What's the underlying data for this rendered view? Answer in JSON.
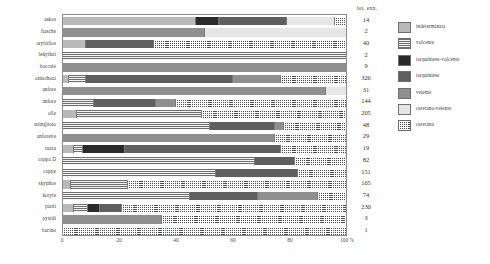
{
  "chart_data": {
    "type": "bar",
    "subtype": "100% stacked horizontal bar",
    "title": "",
    "xlabel": "",
    "ylabel": "",
    "xlim": [
      0,
      100
    ],
    "xticks": [
      {
        "value": 0,
        "label": "0"
      },
      {
        "value": 20,
        "label": "20"
      },
      {
        "value": 40,
        "label": "40"
      },
      {
        "value": 60,
        "label": "60"
      },
      {
        "value": 80,
        "label": "80"
      },
      {
        "value": 100,
        "label": "100 %"
      }
    ],
    "grid": false,
    "legend_position": "right",
    "series": [
      {
        "name": "indeterminata",
        "key": "indeterminata",
        "pattern": "solid-light-gray",
        "color": "#b9b9b9"
      },
      {
        "name": "volcente",
        "key": "volcente",
        "pattern": "horizontal-lines",
        "color": "#f2f2f2"
      },
      {
        "name": "tarquiniese-volcente",
        "key": "tarquiniese_volcente",
        "pattern": "solid-black",
        "color": "#2a2a2a"
      },
      {
        "name": "tarquiniese",
        "key": "tarquiniese",
        "pattern": "solid-dark-gray",
        "color": "#5f5f5f"
      },
      {
        "name": "veiente",
        "key": "veiente",
        "pattern": "solid-mid-gray",
        "color": "#8f8f8f"
      },
      {
        "name": "ceretano-veiente",
        "key": "ceretano_veiente",
        "pattern": "solid-near-white",
        "color": "#e6e6e6"
      },
      {
        "name": "ceretana",
        "key": "ceretana",
        "pattern": "grid-dots",
        "color": "#4a4a4a"
      }
    ],
    "categories": [
      "askos",
      "fiasche",
      "aryballos",
      "lekythoi",
      "boccale",
      "oinochoai",
      "anfore",
      "anfore",
      "olle",
      "attingitoio",
      "anforette",
      "tazza",
      "coppa D",
      "coppe",
      "skyphos",
      "kotyle",
      "piatti",
      "pyxidi",
      "bacino"
    ],
    "totals_header": "tot. exx.",
    "rows": [
      {
        "label": "askos",
        "total": "14",
        "values": [
          47,
          0,
          8,
          24,
          0,
          17,
          4
        ]
      },
      {
        "label": "fiasche",
        "total": "2",
        "values": [
          0,
          0,
          0,
          0,
          50,
          50,
          0
        ]
      },
      {
        "label": "aryballos",
        "total": "40",
        "values": [
          8,
          0,
          0,
          24,
          0,
          0,
          68
        ]
      },
      {
        "label": "lekythoi",
        "total": "2",
        "values": [
          0,
          100,
          0,
          0,
          0,
          0,
          0
        ]
      },
      {
        "label": "boccale",
        "total": "9",
        "values": [
          0,
          0,
          0,
          0,
          100,
          0,
          0
        ]
      },
      {
        "label": "oinochoai",
        "total": "326",
        "values": [
          2,
          6,
          0,
          52,
          17,
          0,
          23
        ]
      },
      {
        "label": "anfore",
        "total": "31",
        "values": [
          0,
          0,
          0,
          0,
          93,
          7,
          0
        ]
      },
      {
        "label": "anfore",
        "total": "144",
        "values": [
          0,
          11,
          0,
          22,
          7,
          0,
          60
        ]
      },
      {
        "label": "olle",
        "total": "205",
        "values": [
          5,
          44,
          0,
          0,
          0,
          0,
          51
        ]
      },
      {
        "label": "attingitoio",
        "total": "48",
        "values": [
          0,
          52,
          0,
          23,
          3,
          0,
          22
        ]
      },
      {
        "label": "anforette",
        "total": "29",
        "values": [
          0,
          0,
          0,
          0,
          75,
          0,
          25
        ]
      },
      {
        "label": "tazza",
        "total": "19",
        "values": [
          4,
          3,
          15,
          55,
          0,
          0,
          23
        ]
      },
      {
        "label": "coppa D",
        "total": "82",
        "values": [
          0,
          68,
          0,
          14,
          0,
          0,
          18
        ]
      },
      {
        "label": "coppe",
        "total": "151",
        "values": [
          0,
          54,
          0,
          29,
          0,
          0,
          17
        ]
      },
      {
        "label": "skyphos",
        "total": "165",
        "values": [
          3,
          20,
          0,
          0,
          0,
          0,
          77
        ]
      },
      {
        "label": "kotyle",
        "total": "74",
        "values": [
          0,
          45,
          0,
          24,
          21,
          0,
          10
        ]
      },
      {
        "label": "piatti",
        "total": "230",
        "values": [
          4,
          5,
          4,
          8,
          0,
          0,
          79
        ]
      },
      {
        "label": "pyxidi",
        "total": "3",
        "values": [
          0,
          0,
          0,
          0,
          35,
          0,
          65
        ]
      },
      {
        "label": "bacino",
        "total": "1",
        "values": [
          0,
          0,
          0,
          0,
          0,
          0,
          100
        ]
      }
    ]
  }
}
